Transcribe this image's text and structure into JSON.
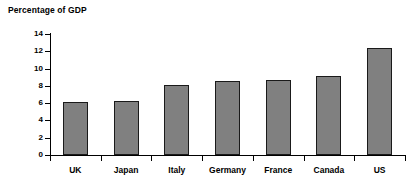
{
  "chart_data": {
    "type": "bar",
    "title": "Percentage of GDP",
    "xlabel": "",
    "ylabel": "",
    "ylim": [
      0,
      14
    ],
    "yticks": [
      0,
      2,
      4,
      6,
      8,
      10,
      12,
      14
    ],
    "grid": false,
    "legend": "none",
    "bar_color": "#808080",
    "bar_edge_color": "#1a1a1a",
    "background_color": "#ffffff",
    "axis_color": "#000000",
    "categories": [
      "UK",
      "Japan",
      "Italy",
      "Germany",
      "France",
      "Canada",
      "US"
    ],
    "values": [
      6.1,
      6.3,
      8.1,
      8.6,
      8.7,
      9.1,
      12.4
    ]
  }
}
